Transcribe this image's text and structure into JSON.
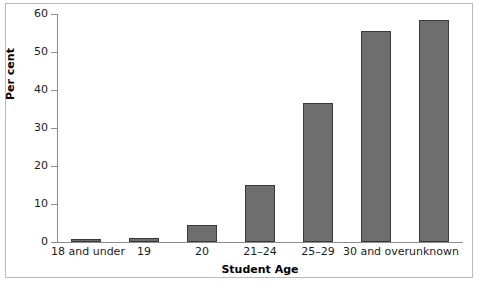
{
  "chart_data": {
    "type": "bar",
    "title": "",
    "xlabel": "Student Age",
    "ylabel": "Per cent",
    "categories": [
      "18 and under",
      "19",
      "20",
      "21–24",
      "25–29",
      "30 and over",
      "unknown"
    ],
    "values": [
      0.7,
      1.1,
      4.5,
      15.0,
      36.5,
      55.5,
      58.4
    ],
    "ylim": [
      0,
      60
    ],
    "yticks": [
      0,
      10,
      20,
      30,
      40,
      50,
      60
    ],
    "ytick_labels": [
      "0",
      "10",
      "20",
      "30",
      "40",
      "50",
      "60"
    ],
    "grid": false,
    "legend": false,
    "bar_color": "#6e6e6e",
    "bar_edge_color": "#3a3a3a",
    "frame_color": "#b9b9b9",
    "axis_color": "#8c8c8c"
  }
}
